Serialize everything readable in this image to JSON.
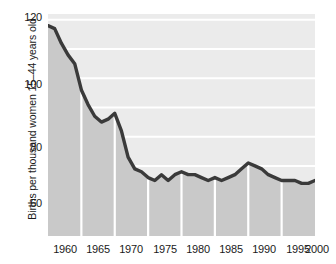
{
  "chart_data": {
    "type": "area",
    "title": "",
    "subtitle": "",
    "xlabel": "",
    "ylabel": "Births per thousand women 15–44 years old",
    "xlim": [
      1960,
      2000
    ],
    "ylim": [
      46,
      122
    ],
    "grid": true,
    "legend": "none",
    "gridlines_horizontal_at": [
      60,
      70,
      80,
      90,
      100,
      110,
      120
    ],
    "gridlines_vertical_at": [
      1965,
      1970,
      1975,
      1980,
      1985,
      1990,
      1995
    ],
    "y_ticks": [
      "120",
      "100",
      "80",
      "60"
    ],
    "y_tick_values": [
      120,
      100,
      80,
      60
    ],
    "x_ticks": [
      "1960",
      "1965",
      "1970",
      "1975",
      "1980",
      "1985",
      "1990",
      "1995",
      "2000"
    ],
    "x_tick_values": [
      1960,
      1965,
      1970,
      1975,
      1980,
      1985,
      1990,
      1995,
      2000
    ],
    "series": [
      {
        "name": "Births per thousand women 15–44 years old",
        "line_color": "#3a3a3a",
        "fill_color": "#c9c9c9",
        "x": [
          1960,
          1961,
          1962,
          1963,
          1964,
          1965,
          1966,
          1967,
          1968,
          1969,
          1970,
          1971,
          1972,
          1973,
          1974,
          1975,
          1976,
          1977,
          1978,
          1979,
          1980,
          1981,
          1982,
          1983,
          1984,
          1985,
          1986,
          1987,
          1988,
          1989,
          1990,
          1991,
          1992,
          1993,
          1994,
          1995,
          1996,
          1997,
          1998,
          1999,
          2000
        ],
        "values": [
          118,
          117,
          112,
          108,
          105,
          96,
          91,
          87,
          85,
          86,
          88,
          82,
          73,
          69,
          68,
          66,
          65,
          67,
          65,
          67,
          68,
          67,
          67,
          66,
          65,
          66,
          65,
          66,
          67,
          69,
          71,
          70,
          69,
          67,
          66,
          65,
          65,
          65,
          64,
          64,
          65
        ]
      }
    ]
  },
  "axis": {
    "y_label": "Births per thousand women 15–44 years old",
    "y_ticks": [
      {
        "label": "120",
        "value": 120
      },
      {
        "label": "100",
        "value": 100
      },
      {
        "label": "80",
        "value": 80
      },
      {
        "label": "60",
        "value": 60
      }
    ],
    "x_ticks": [
      {
        "label": "1960",
        "value": 1960
      },
      {
        "label": "1965",
        "value": 1965
      },
      {
        "label": "1970",
        "value": 1970
      },
      {
        "label": "1975",
        "value": 1975
      },
      {
        "label": "1980",
        "value": 1980
      },
      {
        "label": "1985",
        "value": 1985
      },
      {
        "label": "1990",
        "value": 1990
      },
      {
        "label": "1995",
        "value": 1995
      },
      {
        "label": "2000",
        "value": 2000
      }
    ]
  },
  "colors": {
    "background": "#ffffff",
    "plot_fill": "#c9c9c9",
    "plot_upper_fill": "#ebebeb",
    "line": "#3a3a3a",
    "gridline": "#ffffff",
    "text": "#1a1a1a"
  }
}
